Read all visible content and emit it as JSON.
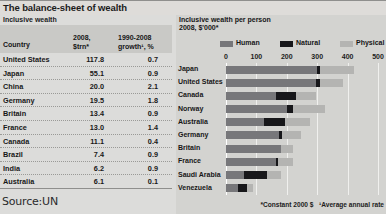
{
  "title": "The balance-sheet of wealth",
  "source": "Source:UN",
  "table": {
    "subtitle": "Inclusive wealth",
    "headers": {
      "country": "Country",
      "col2_line1": "2008,",
      "col2_line2": "$trn*",
      "col3_line1": "1990-2008",
      "col3_line2": "growth¹, %"
    },
    "rows": [
      {
        "country": "United States",
        "wealth": "117.8",
        "growth": "0.7"
      },
      {
        "country": "Japan",
        "wealth": "55.1",
        "growth": "0.9"
      },
      {
        "country": "China",
        "wealth": "20.0",
        "growth": "2.1"
      },
      {
        "country": "Germany",
        "wealth": "19.5",
        "growth": "1.8"
      },
      {
        "country": "Britain",
        "wealth": "13.4",
        "growth": "0.9"
      },
      {
        "country": "France",
        "wealth": "13.0",
        "growth": "1.4"
      },
      {
        "country": "Canada",
        "wealth": "11.1",
        "growth": "0.4"
      },
      {
        "country": "Brazil",
        "wealth": "7.4",
        "growth": "0.9"
      },
      {
        "country": "India",
        "wealth": "6.2",
        "growth": "0.9"
      },
      {
        "country": "Australia",
        "wealth": "6.1",
        "growth": "0.1"
      }
    ]
  },
  "chart": {
    "title": "Inclusive wealth per person",
    "subtitle": "2008, $'000*",
    "footnote_constant": "*Constant 2000 $",
    "footnote_growth": "¹Average annual rate",
    "legend": [
      {
        "name": "Human",
        "color": "#77777a"
      },
      {
        "name": "Natural",
        "color": "#17171a"
      },
      {
        "name": "Physical",
        "color": "#b4b4b2"
      }
    ]
  },
  "chart_data": {
    "type": "bar",
    "orientation": "horizontal",
    "stacked": true,
    "title": "Inclusive wealth per person",
    "subtitle": "2008, $'000*",
    "xlabel": "",
    "ylabel": "",
    "xlim": [
      0,
      500
    ],
    "xticks": [
      0,
      100,
      200,
      300,
      400,
      500
    ],
    "grid": true,
    "legend_position": "top",
    "categories": [
      "Japan",
      "United States",
      "Canada",
      "Norway",
      "Australia",
      "Germany",
      "Britain",
      "France",
      "Saudi Arabia",
      "Venezuela"
    ],
    "series": [
      {
        "name": "Human",
        "color": "#77777a",
        "values": [
          300,
          295,
          165,
          200,
          125,
          175,
          180,
          165,
          60,
          40
        ]
      },
      {
        "name": "Natural",
        "color": "#17171a",
        "values": [
          8,
          14,
          65,
          20,
          70,
          8,
          2,
          5,
          75,
          30
        ]
      },
      {
        "name": "Physical",
        "color": "#b4b4b2",
        "values": [
          112,
          76,
          65,
          105,
          80,
          65,
          40,
          50,
          45,
          20
        ]
      }
    ],
    "totals": [
      420,
      385,
      295,
      325,
      275,
      248,
      222,
      220,
      180,
      90
    ]
  }
}
